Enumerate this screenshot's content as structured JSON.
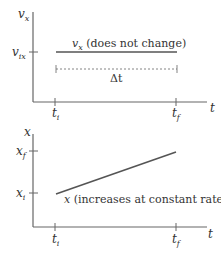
{
  "top_graph": {
    "y_axis_label": "v",
    "y_axis_sub": "x",
    "x_axis_label": "t",
    "y_tick_label": "v",
    "y_tick_sub": "ix",
    "line_label_var": "v",
    "line_label_sub": "x",
    "line_label_text": " (does not change)",
    "interval_label": "Δt",
    "tick_ti": "t",
    "tick_ti_sub": "i",
    "tick_tf": "t",
    "tick_tf_sub": "f"
  },
  "bottom_graph": {
    "y_axis_label": "x",
    "x_axis_label": "t",
    "y_tick_top": "x",
    "y_tick_top_sub": "f",
    "y_tick_bottom": "x",
    "y_tick_bottom_sub": "i",
    "line_label_var": "x",
    "line_label_text": " (increases at constant rate)",
    "tick_ti": "t",
    "tick_ti_sub": "i",
    "tick_tf": "t",
    "tick_tf_sub": "f"
  },
  "colors": {
    "axis": "#555555",
    "line": "#555555",
    "text": "#333333"
  }
}
